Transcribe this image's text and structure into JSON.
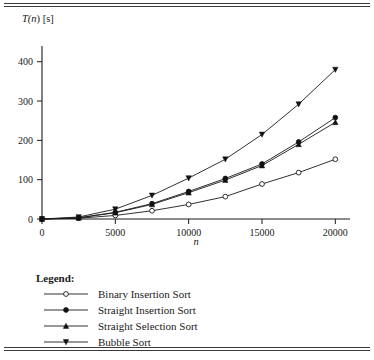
{
  "figure": {
    "y_axis_caption": "T(n) [s]",
    "y_axis_caption_parts": {
      "t": "T(",
      "n": "n",
      "close": ") [s]"
    },
    "x_axis_caption": "n"
  },
  "legend": {
    "title": "Legend:",
    "entries": [
      {
        "label": "Binary Insertion Sort",
        "marker": "open-circle-marker"
      },
      {
        "label": "Straight Insertion Sort",
        "marker": "filled-circle-marker"
      },
      {
        "label": "Straight Selection Sort",
        "marker": "filled-triangle-up-marker"
      },
      {
        "label": "Bubble Sort",
        "marker": "filled-triangle-down-marker"
      }
    ]
  },
  "chart_data": {
    "type": "line",
    "title": "",
    "xlabel": "n",
    "ylabel": "T(n) [s]",
    "xlim": [
      0,
      21000
    ],
    "ylim": [
      0,
      440
    ],
    "grid": false,
    "legend_position": "below-plot",
    "xticks": [
      0,
      5000,
      10000,
      15000,
      20000
    ],
    "xtick_labels": [
      "0",
      "5000",
      "10000",
      "15000",
      "20000"
    ],
    "yticks": [
      0,
      100,
      200,
      300,
      400
    ],
    "ytick_labels": [
      "0",
      "100",
      "200",
      "300",
      "400"
    ],
    "x": [
      0,
      2500,
      5000,
      7500,
      10000,
      12500,
      15000,
      17500,
      20000
    ],
    "series": [
      {
        "name": "Binary Insertion Sort",
        "marker": "open-circle",
        "values": [
          0,
          2,
          9,
          21,
          37,
          57,
          89,
          118,
          152
        ]
      },
      {
        "name": "Straight Insertion Sort",
        "marker": "filled-circle",
        "values": [
          0,
          3,
          17,
          39,
          70,
          103,
          140,
          196,
          258
        ]
      },
      {
        "name": "Straight Selection Sort",
        "marker": "filled-triangle-up",
        "values": [
          0,
          3,
          16,
          37,
          67,
          99,
          136,
          190,
          246
        ]
      },
      {
        "name": "Bubble Sort",
        "marker": "filled-triangle-down",
        "values": [
          0,
          5,
          25,
          60,
          104,
          152,
          215,
          292,
          380
        ]
      }
    ]
  }
}
